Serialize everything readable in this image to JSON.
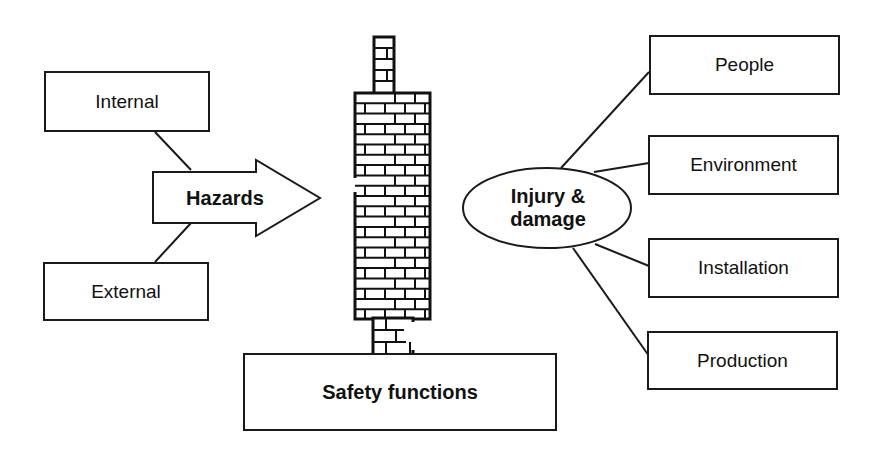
{
  "diagram": {
    "hazard_sources": [
      {
        "label": "Internal"
      },
      {
        "label": "External"
      }
    ],
    "hazards_arrow": {
      "label": "Hazards"
    },
    "barrier": {
      "name": "brick-wall"
    },
    "safety_functions": {
      "label": "Safety functions"
    },
    "consequence": {
      "label_line1": "Injury &",
      "label_line2": "damage"
    },
    "targets": [
      {
        "label": "People"
      },
      {
        "label": "Environment"
      },
      {
        "label": "Installation"
      },
      {
        "label": "Production"
      }
    ],
    "colors": {
      "stroke": "#1a1a1a",
      "background": "#ffffff"
    }
  }
}
